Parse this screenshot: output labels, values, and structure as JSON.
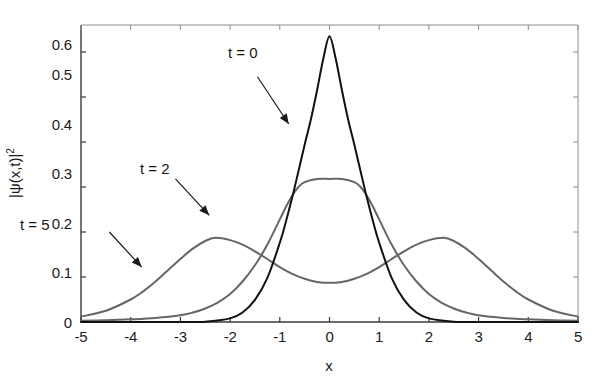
{
  "chart_data": {
    "type": "line",
    "title": "",
    "xlabel": "x",
    "ylabel": "|ψ(x,t)|²",
    "xlim": [
      -5,
      5
    ],
    "ylim": [
      0,
      0.66
    ],
    "grid": false,
    "legend_position": "inline-annotations",
    "xticks": [
      "-5",
      "-4",
      "-3",
      "-2",
      "-1",
      "0",
      "1",
      "2",
      "3",
      "4",
      "5"
    ],
    "xtick_values": [
      -5,
      -4,
      -3,
      -2,
      -1,
      0,
      1,
      2,
      3,
      4,
      5
    ],
    "yticks": [
      "0",
      "0.1",
      "0.2",
      "0.3",
      "0.4",
      "0.5",
      "0.6"
    ],
    "ytick_values": [
      0,
      0.1,
      0.2,
      0.3,
      0.4,
      0.5,
      0.6
    ],
    "series": [
      {
        "name": "t = 0",
        "color": "#111111",
        "linewidth": 2.0,
        "peak_value": 0.635,
        "peak_x": 0,
        "x": [
          -5,
          -4.5,
          -4,
          -3.5,
          -3,
          -2.5,
          -2,
          -1.75,
          -1.5,
          -1.25,
          -1,
          -0.875,
          -0.75,
          -0.625,
          -0.5,
          -0.375,
          -0.25,
          -0.125,
          0,
          0.125,
          0.25,
          0.375,
          0.5,
          0.625,
          0.75,
          0.875,
          1,
          1.25,
          1.5,
          1.75,
          2,
          2.5,
          3,
          3.5,
          4,
          4.5,
          5
        ],
        "values": [
          0.0,
          0.0,
          0.0,
          0.0,
          0.0,
          0.0007,
          0.008,
          0.021,
          0.049,
          0.098,
          0.176,
          0.224,
          0.277,
          0.335,
          0.394,
          0.45,
          0.515,
          0.585,
          0.635,
          0.585,
          0.515,
          0.45,
          0.394,
          0.335,
          0.277,
          0.224,
          0.176,
          0.098,
          0.049,
          0.021,
          0.008,
          0.0007,
          0.0,
          0.0,
          0.0,
          0.0,
          0.0
        ]
      },
      {
        "name": "t = 2",
        "color": "#666666",
        "linewidth": 2.0,
        "peak_value": 0.318,
        "peak_x": 0,
        "x": [
          -5,
          -4.5,
          -4,
          -3.5,
          -3,
          -2.75,
          -2.5,
          -2.25,
          -2,
          -1.75,
          -1.5,
          -1.25,
          -1,
          -0.875,
          -0.75,
          -0.625,
          -0.5,
          -0.25,
          0,
          0.25,
          0.5,
          0.625,
          0.75,
          0.875,
          1,
          1.25,
          1.5,
          1.75,
          2,
          2.25,
          2.5,
          2.75,
          3,
          3.5,
          4,
          4.5,
          5
        ],
        "values": [
          0.003,
          0.004,
          0.006,
          0.009,
          0.015,
          0.021,
          0.03,
          0.043,
          0.062,
          0.09,
          0.126,
          0.172,
          0.228,
          0.256,
          0.281,
          0.3,
          0.311,
          0.318,
          0.318,
          0.318,
          0.311,
          0.3,
          0.281,
          0.256,
          0.228,
          0.172,
          0.126,
          0.09,
          0.062,
          0.043,
          0.03,
          0.021,
          0.015,
          0.009,
          0.006,
          0.004,
          0.003
        ]
      },
      {
        "name": "t = 5",
        "color": "#666666",
        "linewidth": 2.0,
        "peak_value": 0.187,
        "peak_x": 2.3,
        "center_dip_value": 0.087,
        "x": [
          -5,
          -4.5,
          -4,
          -3.75,
          -3.5,
          -3.25,
          -3,
          -2.75,
          -2.5,
          -2.3,
          -2,
          -1.75,
          -1.5,
          -1.25,
          -1,
          -0.75,
          -0.5,
          -0.25,
          0,
          0.25,
          0.5,
          0.75,
          1,
          1.25,
          1.5,
          1.75,
          2,
          2.3,
          2.5,
          2.75,
          3,
          3.25,
          3.5,
          3.75,
          4,
          4.5,
          5
        ],
        "values": [
          0.012,
          0.025,
          0.05,
          0.068,
          0.09,
          0.115,
          0.14,
          0.163,
          0.18,
          0.187,
          0.182,
          0.172,
          0.157,
          0.14,
          0.122,
          0.107,
          0.096,
          0.089,
          0.087,
          0.089,
          0.096,
          0.107,
          0.122,
          0.14,
          0.157,
          0.172,
          0.182,
          0.187,
          0.18,
          0.163,
          0.14,
          0.115,
          0.09,
          0.068,
          0.05,
          0.025,
          0.012
        ]
      }
    ],
    "annotations": [
      {
        "text": "t = 0",
        "arrow_from": [
          -1.45,
          0.545
        ],
        "arrow_to": [
          -0.82,
          0.44
        ]
      },
      {
        "text": "t = 2",
        "arrow_from": [
          -3.1,
          0.318
        ],
        "arrow_to": [
          -2.42,
          0.237
        ]
      },
      {
        "text": "t = 5",
        "arrow_from": [
          -4.43,
          0.2
        ],
        "arrow_to": [
          -3.78,
          0.122
        ]
      }
    ]
  }
}
